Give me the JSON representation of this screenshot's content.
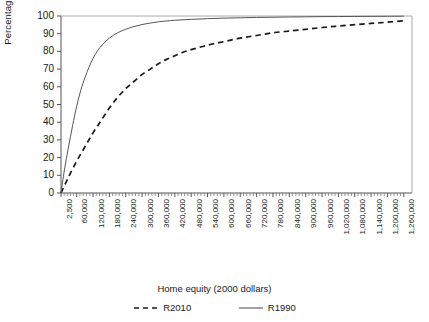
{
  "chart_data": {
    "type": "line",
    "title": "",
    "xlabel": "Home equity (2000 dollars)",
    "ylabel": "Percentage",
    "ylim": [
      0,
      100
    ],
    "yticks": [
      0,
      10,
      20,
      30,
      40,
      50,
      60,
      70,
      80,
      90,
      100
    ],
    "xlim": [
      2500,
      1290000
    ],
    "grid": false,
    "legend_position": "bottom",
    "xtick_labels": [
      "2,500",
      "60,000",
      "120,000",
      "180,000",
      "240,000",
      "300,000",
      "360,000",
      "420,000",
      "480,000",
      "540,000",
      "600,000",
      "660,000",
      "720,000",
      "780,000",
      "840,000",
      "900,000",
      "960,000",
      "1,020,000",
      "1,080,000",
      "1,140,000",
      "1,200,000",
      "1,260,000"
    ],
    "xtick_values": [
      2500,
      60000,
      120000,
      180000,
      240000,
      300000,
      360000,
      420000,
      480000,
      540000,
      600000,
      660000,
      720000,
      780000,
      840000,
      900000,
      960000,
      1020000,
      1080000,
      1140000,
      1200000,
      1260000
    ],
    "minor_tick_count_per_interval": 4,
    "series": [
      {
        "name": "R2010",
        "style": "dashed",
        "color": "#1a1a1a",
        "x": [
          2500,
          30000,
          60000,
          90000,
          120000,
          150000,
          180000,
          210000,
          240000,
          270000,
          300000,
          330000,
          360000,
          390000,
          420000,
          450000,
          480000,
          540000,
          600000,
          660000,
          720000,
          780000,
          840000,
          900000,
          960000,
          1020000,
          1080000,
          1140000,
          1200000,
          1260000
        ],
        "y": [
          0,
          9,
          18,
          26,
          34,
          41,
          48,
          54,
          59,
          63,
          67,
          70,
          73,
          75.5,
          77.5,
          79.5,
          81,
          83.5,
          85.5,
          87.5,
          89,
          90.5,
          91.5,
          92.5,
          93.5,
          94.3,
          95.1,
          95.8,
          96.5,
          97.3
        ]
      },
      {
        "name": "R1990",
        "style": "solid",
        "color": "#555555",
        "x": [
          2500,
          15000,
          30000,
          45000,
          60000,
          75000,
          90000,
          105000,
          120000,
          135000,
          150000,
          180000,
          210000,
          240000,
          270000,
          300000,
          330000,
          360000,
          420000,
          480000,
          540000,
          600000,
          660000,
          720000,
          780000,
          840000,
          900000,
          960000,
          1020000,
          1080000,
          1140000,
          1200000,
          1260000
        ],
        "y": [
          0,
          13,
          26,
          38,
          49,
          58,
          65,
          71,
          76,
          80,
          83,
          87.5,
          90.5,
          92.5,
          94,
          95.2,
          96.0,
          96.7,
          97.6,
          98.1,
          98.5,
          98.8,
          99.0,
          99.2,
          99.3,
          99.45,
          99.55,
          99.65,
          99.7,
          99.75,
          99.8,
          99.85,
          99.9
        ]
      }
    ]
  },
  "legend": {
    "entries": [
      {
        "label": "R2010",
        "style": "dashed"
      },
      {
        "label": "R1990",
        "style": "solid"
      }
    ]
  }
}
